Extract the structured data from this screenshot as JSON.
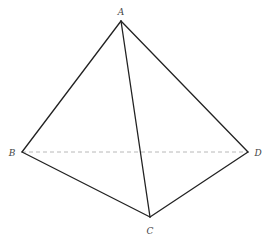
{
  "diagram": {
    "type": "tetrahedron",
    "vertices": [
      {
        "id": "A",
        "label": "A"
      },
      {
        "id": "B",
        "label": "B"
      },
      {
        "id": "C",
        "label": "C"
      },
      {
        "id": "D",
        "label": "D"
      }
    ],
    "edges": [
      {
        "from": "A",
        "to": "B",
        "style": "solid"
      },
      {
        "from": "A",
        "to": "C",
        "style": "solid"
      },
      {
        "from": "A",
        "to": "D",
        "style": "solid"
      },
      {
        "from": "B",
        "to": "C",
        "style": "solid"
      },
      {
        "from": "C",
        "to": "D",
        "style": "solid"
      },
      {
        "from": "B",
        "to": "D",
        "style": "dashed"
      }
    ],
    "colors": {
      "edge": "#222222",
      "hidden_edge": "#b8b8b8",
      "label": "#444444"
    }
  }
}
